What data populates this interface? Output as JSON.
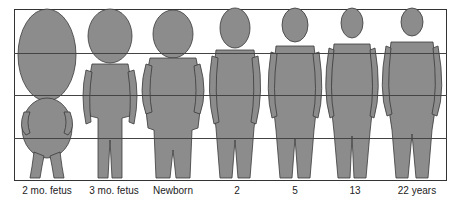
{
  "figure": {
    "fill_color": "#8c8c8c",
    "outline_color": "#3a3a3a",
    "grid_color": "#444444",
    "grid_divisions": 4
  },
  "stages": [
    {
      "label": "2 mo. fetus",
      "x": 47
    },
    {
      "label": "3 mo. fetus",
      "x": 114
    },
    {
      "label": "Newborn",
      "x": 173
    },
    {
      "label": "2",
      "x": 237
    },
    {
      "label": "5",
      "x": 295
    },
    {
      "label": "13",
      "x": 355
    },
    {
      "label": "22 years",
      "x": 417
    }
  ]
}
